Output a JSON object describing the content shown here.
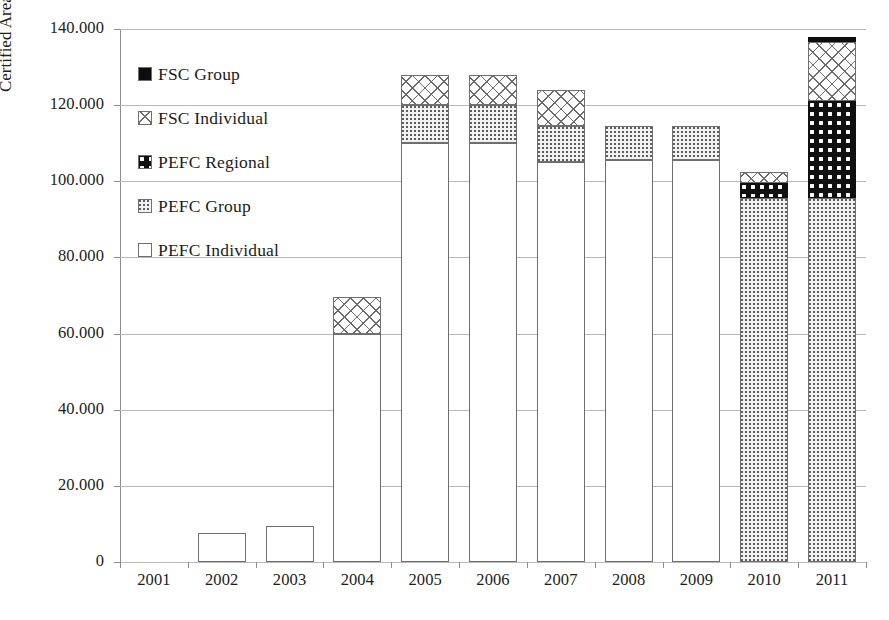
{
  "chart_data": {
    "type": "bar",
    "stacked": true,
    "title": "",
    "xlabel": "",
    "ylabel": "Certified Area (hectares)",
    "categories": [
      "2001",
      "2002",
      "2003",
      "2004",
      "2005",
      "2006",
      "2007",
      "2008",
      "2009",
      "2010",
      "2011"
    ],
    "ylim": [
      0,
      140000
    ],
    "ytick_values": [
      0,
      20000,
      40000,
      60000,
      80000,
      100000,
      120000,
      140000
    ],
    "ytick_labels": [
      "0",
      "20.000",
      "40.000",
      "60.000",
      "80.000",
      "100.000",
      "120.000",
      "140.000"
    ],
    "grid": true,
    "legend_position": "upper-left-inside",
    "series": [
      {
        "name": "PEFC Individual",
        "swatch": "white-solid",
        "values": [
          0,
          7500,
          9500,
          60000,
          110000,
          110000,
          105000,
          105500,
          105500,
          0,
          0
        ]
      },
      {
        "name": "PEFC Group",
        "swatch": "light-dotted",
        "values": [
          0,
          0,
          0,
          0,
          10000,
          10000,
          9500,
          9000,
          9000,
          95500,
          95500
        ]
      },
      {
        "name": "PEFC Regional",
        "swatch": "dark-dotted",
        "values": [
          0,
          0,
          0,
          0,
          0,
          0,
          0,
          0,
          0,
          4000,
          25500
        ]
      },
      {
        "name": "FSC Individual",
        "swatch": "light-crosshatch",
        "values": [
          0,
          0,
          0,
          9500,
          8000,
          8000,
          9500,
          0,
          0,
          3000,
          15500
        ]
      },
      {
        "name": "FSC Group",
        "swatch": "black-solid",
        "values": [
          0,
          0,
          0,
          0,
          0,
          0,
          0,
          0,
          0,
          0,
          1500
        ]
      }
    ],
    "totals": [
      0,
      7500,
      9500,
      69500,
      128000,
      128000,
      124000,
      114500,
      114500,
      102500,
      138000
    ]
  },
  "legend": {
    "items": [
      {
        "label": "FSC Group",
        "swatch": "black-solid"
      },
      {
        "label": "FSC Individual",
        "swatch": "light-crosshatch"
      },
      {
        "label": "PEFC Regional",
        "swatch": "dark-dotted"
      },
      {
        "label": "PEFC Group",
        "swatch": "light-dotted"
      },
      {
        "label": "PEFC Individual",
        "swatch": "white-solid"
      }
    ]
  },
  "caption": {
    "text": ""
  },
  "colors": {
    "axis": "#8d8d8d",
    "grid": "#b9b9b9",
    "text": "#1c1c1c",
    "dark_fill": "#101010",
    "light_fill": "#f2f2f2"
  }
}
